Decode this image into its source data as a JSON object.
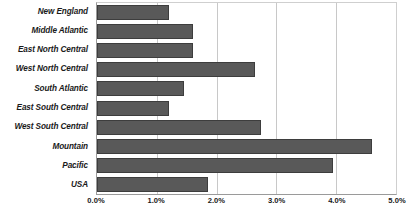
{
  "chart_data": {
    "type": "bar",
    "orientation": "horizontal",
    "title": "",
    "xlabel": "",
    "ylabel": "",
    "xlim": [
      0,
      5
    ],
    "xtick_labels": [
      "0.0%",
      "1.0%",
      "2.0%",
      "3.0%",
      "4.0%",
      "5.0%"
    ],
    "xtick_values": [
      0,
      1,
      2,
      3,
      4,
      5
    ],
    "grid": true,
    "legend": "none",
    "bar_color": "#595959",
    "bar_border_color": "#3d3d3d",
    "gridline_color": "#c8c8c8",
    "axis_color": "#9a9a9a",
    "categories": [
      "New England",
      "Middle Atlantic",
      "East North Central",
      "West North Central",
      "South Atlantic",
      "East South Central",
      "West South Central",
      "Mountain",
      "Pacific",
      "USA"
    ],
    "values": [
      1.2,
      1.6,
      1.6,
      2.65,
      1.45,
      1.2,
      2.75,
      4.6,
      3.95,
      1.85
    ]
  }
}
